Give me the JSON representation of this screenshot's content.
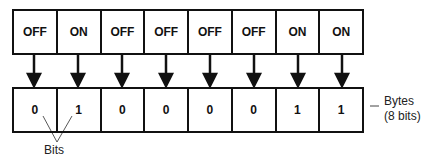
{
  "switches": [
    "OFF",
    "ON",
    "OFF",
    "OFF",
    "OFF",
    "OFF",
    "ON",
    "ON"
  ],
  "bits": [
    "0",
    "1",
    "0",
    "0",
    "0",
    "0",
    "1",
    "1"
  ],
  "labels": {
    "bits": "Bits",
    "bytes_line1": "Bytes",
    "bytes_line2": "(8 bits)"
  },
  "colors": {
    "stroke": "#111111",
    "background": "#ffffff"
  }
}
